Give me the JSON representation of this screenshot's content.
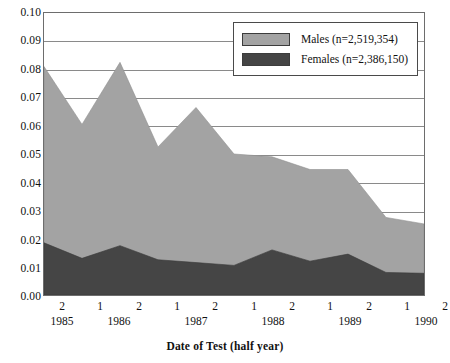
{
  "chart_data": {
    "type": "area",
    "stacked": true,
    "title": "",
    "xlabel": "Date of Test (half year)",
    "ylabel": "",
    "ylim": [
      0.0,
      0.1
    ],
    "ytick_step": 0.01,
    "grid": true,
    "legend_position": "top-center",
    "categories": [
      "1985-2",
      "1986-1",
      "1986-2",
      "1987-1",
      "1987-2",
      "1988-1",
      "1988-2",
      "1989-1",
      "1989-2",
      "1990-1",
      "1990-2"
    ],
    "x_half_labels": [
      "2",
      "1",
      "2",
      "1",
      "2",
      "1",
      "2",
      "1",
      "2",
      "1",
      "2"
    ],
    "x_year_labels": [
      "1985",
      "1986",
      "1987",
      "1988",
      "1989",
      "1990"
    ],
    "y_tick_labels": [
      "0.00",
      "0.01",
      "0.02",
      "0.03",
      "0.04",
      "0.05",
      "0.06",
      "0.07",
      "0.08",
      "0.09",
      "0.10"
    ],
    "series": [
      {
        "name": "Males (n=2,519,354)",
        "short_name": "Males",
        "n": "2,519,354",
        "color": "#a3a3a3",
        "values": [
          0.0625,
          0.0475,
          0.065,
          0.04,
          0.055,
          0.0395,
          0.033,
          0.0325,
          0.03,
          0.0195,
          0.0175
        ]
      },
      {
        "name": "Females (n=2,386,150)",
        "short_name": "Females",
        "n": "2,386,150",
        "color": "#454545",
        "values": [
          0.0185,
          0.013,
          0.0175,
          0.0125,
          0.0115,
          0.0105,
          0.016,
          0.012,
          0.0145,
          0.008,
          0.0077
        ]
      }
    ],
    "totals": [
      0.081,
      0.0605,
      0.0825,
      0.0525,
      0.0665,
      0.05,
      0.049,
      0.0445,
      0.0445,
      0.0275,
      0.0252
    ]
  },
  "colors": {
    "males_fill": "#a3a3a3",
    "females_fill": "#454545",
    "gridline": "#8a8a8a",
    "frame": "#6d6d6d",
    "background": "#ffffff",
    "text": "#111111"
  },
  "legend": {
    "rows": [
      {
        "label": "Males (n=2,519,354)",
        "swatch": "#a3a3a3"
      },
      {
        "label": "Females (n=2,386,150)",
        "swatch": "#454545"
      }
    ]
  },
  "axis": {
    "x_title": "Date of Test (half year)"
  }
}
